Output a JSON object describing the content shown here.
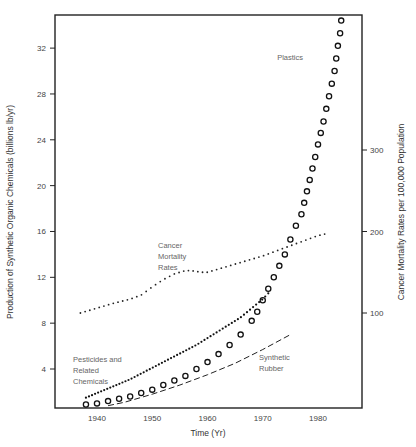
{
  "chart_data": {
    "type": "scatter",
    "title": "",
    "xlabel": "Time (Yr)",
    "ylabel": "Production of Synthetic Organic Chemicals (billions lb/yr)",
    "ylabel_right": "Cancer Mortality Rates per 100,000 Population",
    "xlim": [
      1933,
      1988
    ],
    "ylim": [
      0.7,
      35.5
    ],
    "ylim_right": [
      90,
      350
    ],
    "x_ticks": [
      1940,
      1950,
      1960,
      1970,
      1980
    ],
    "y_ticks": [
      4,
      8,
      12,
      16,
      20,
      24,
      28,
      32
    ],
    "y_ticks_right": [
      100,
      200,
      300
    ],
    "grid": false,
    "legend": "none (inline annotations)",
    "series": [
      {
        "name": "Plastics",
        "axis": "left",
        "marker": "open-circle",
        "x": [
          1938,
          1940,
          1942,
          1944,
          1946,
          1948,
          1950,
          1952,
          1954,
          1956,
          1958,
          1960,
          1962,
          1964,
          1966,
          1968,
          1969,
          1970,
          1971,
          1972,
          1973,
          1974,
          1975,
          1976,
          1977,
          1977.5,
          1978,
          1978.5,
          1979,
          1979.5,
          1980,
          1980.5,
          1981,
          1981.5,
          1982,
          1982.5,
          1983,
          1983.3,
          1983.6,
          1984,
          1984.2
        ],
        "values": [
          0.9,
          1.0,
          1.2,
          1.4,
          1.6,
          1.9,
          2.2,
          2.6,
          3.0,
          3.4,
          4.0,
          4.6,
          5.3,
          6.1,
          7.0,
          8.2,
          9.0,
          10.0,
          11.0,
          12.0,
          13.0,
          14.0,
          15.3,
          16.5,
          17.5,
          18.5,
          19.5,
          20.5,
          21.5,
          22.5,
          23.6,
          24.6,
          25.6,
          26.7,
          27.8,
          28.9,
          30.0,
          31.1,
          32.2,
          33.3,
          34.4
        ]
      },
      {
        "name": "Pesticides and Related Chemicals",
        "axis": "left",
        "marker": "filled-dot",
        "x": [
          1938,
          1940,
          1942,
          1944,
          1946,
          1948,
          1950,
          1952,
          1954,
          1956,
          1958,
          1960,
          1962,
          1964,
          1966,
          1968,
          1970,
          1971
        ],
        "values": [
          1.5,
          1.9,
          2.3,
          2.7,
          3.1,
          3.6,
          4.1,
          4.6,
          5.1,
          5.6,
          6.1,
          6.7,
          7.3,
          7.9,
          8.5,
          9.3,
          10.1,
          10.6
        ]
      },
      {
        "name": "Synthetic Rubber",
        "axis": "left",
        "marker": "dashed-line",
        "x": [
          1942,
          1945,
          1950,
          1955,
          1960,
          1965,
          1970,
          1975
        ],
        "values": [
          0.8,
          1.1,
          1.8,
          2.6,
          3.5,
          4.5,
          5.7,
          7.0
        ]
      },
      {
        "name": "Cancer Mortality Rates",
        "axis": "right",
        "marker": "dotted-line",
        "x": [
          1937,
          1940,
          1943,
          1946,
          1948,
          1950,
          1952,
          1954,
          1956,
          1957,
          1958,
          1959,
          1960,
          1962,
          1964,
          1966,
          1968,
          1970,
          1972,
          1974,
          1976,
          1978,
          1980,
          1982
        ],
        "values": [
          100,
          106,
          112,
          117,
          122,
          132,
          141,
          148,
          152,
          152,
          151,
          150,
          150,
          154,
          158,
          162,
          166,
          170,
          175,
          180,
          185,
          190,
          195,
          198
        ]
      }
    ],
    "annotations": [
      {
        "text": "Plastics",
        "near_series": "Plastics"
      },
      {
        "text": [
          "Cancer",
          "Mortality",
          "Rates"
        ],
        "near_series": "Cancer Mortality Rates"
      },
      {
        "text": [
          "Pesticides and",
          "Related",
          "Chemicals"
        ],
        "near_series": "Pesticides and Related Chemicals"
      },
      {
        "text": [
          "Synthetic",
          "Rubber"
        ],
        "near_series": "Synthetic Rubber"
      }
    ]
  },
  "labels": {
    "x_axis_title": "Time (Yr)",
    "y_axis_title_left": "Production of Synthetic Organic Chemicals (billions lb/yr)",
    "y_axis_title_right": "Cancer Mortality Rates per 100,000 Population",
    "plastics": "Plastics",
    "cancer_1": "Cancer",
    "cancer_2": "Mortality",
    "cancer_3": "Rates",
    "pest_1": "Pesticides and",
    "pest_2": "Related",
    "pest_3": "Chemicals",
    "rubber_1": "Synthetic",
    "rubber_2": "Rubber"
  }
}
